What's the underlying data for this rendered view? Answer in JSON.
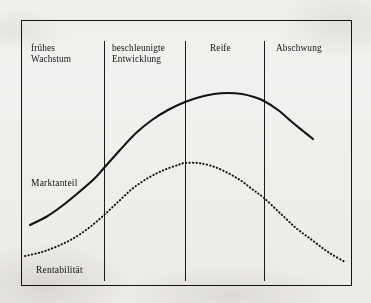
{
  "figure": {
    "background_color": "#f2f1ef",
    "ink_color": "#141414"
  },
  "stages": [
    {
      "id": "fruehes-wachstum",
      "label": "frühes\nWachstum",
      "x": 31,
      "y": 43
    },
    {
      "id": "beschleunigte-entwicklung",
      "label": "beschleunigte\nEntwicklung",
      "x": 112,
      "y": 43
    },
    {
      "id": "reife",
      "label": "Reife",
      "x": 210,
      "y": 43
    },
    {
      "id": "abschwung",
      "label": "Abschwung",
      "x": 276,
      "y": 43
    }
  ],
  "dividers": [
    {
      "id": "divider-1",
      "x": 104,
      "y_top": 41,
      "y_bottom": 281
    },
    {
      "id": "divider-2",
      "x": 185,
      "y_top": 41,
      "y_bottom": 281
    },
    {
      "id": "divider-3",
      "x": 264,
      "y_top": 41,
      "y_bottom": 281
    }
  ],
  "curve_labels": [
    {
      "id": "marktanteil",
      "label": "Marktanteil",
      "x": 31,
      "y": 178
    },
    {
      "id": "rentabilitaet",
      "label": "Rentabilität",
      "x": 36,
      "y": 265
    }
  ],
  "chart_data": {
    "type": "line",
    "xlabel": "",
    "ylabel": "",
    "grid": false,
    "legend_position": "inline-annotations",
    "x_axis_categories": [
      "frühes Wachstum",
      "beschleunigte Entwicklung",
      "Reife",
      "Abschwung"
    ],
    "x_category_boundaries_px": [
      104,
      185,
      264
    ],
    "series": [
      {
        "name": "Marktanteil",
        "style": "solid",
        "color": "#121212",
        "points_px": [
          [
            30,
            225
          ],
          [
            46,
            217
          ],
          [
            62,
            206
          ],
          [
            78,
            193
          ],
          [
            94,
            179
          ],
          [
            104,
            168
          ],
          [
            120,
            150
          ],
          [
            136,
            133
          ],
          [
            152,
            120
          ],
          [
            168,
            110
          ],
          [
            185,
            102
          ],
          [
            200,
            97
          ],
          [
            214,
            94
          ],
          [
            228,
            93
          ],
          [
            242,
            94
          ],
          [
            254,
            97
          ],
          [
            264,
            101
          ],
          [
            278,
            110
          ],
          [
            292,
            122
          ],
          [
            303,
            131
          ],
          [
            313,
            139
          ]
        ],
        "peak_px": [
          228,
          93
        ],
        "start_px": [
          30,
          225
        ],
        "end_px": [
          313,
          139
        ]
      },
      {
        "name": "Rentabilität",
        "style": "dotted",
        "color": "#121212",
        "points_px": [
          [
            25,
            256
          ],
          [
            42,
            252
          ],
          [
            58,
            246
          ],
          [
            74,
            238
          ],
          [
            90,
            227
          ],
          [
            104,
            215
          ],
          [
            118,
            202
          ],
          [
            132,
            189
          ],
          [
            148,
            178
          ],
          [
            164,
            170
          ],
          [
            178,
            165
          ],
          [
            185,
            163
          ],
          [
            198,
            163
          ],
          [
            212,
            166
          ],
          [
            226,
            172
          ],
          [
            240,
            180
          ],
          [
            252,
            189
          ],
          [
            264,
            198
          ],
          [
            280,
            213
          ],
          [
            296,
            228
          ],
          [
            312,
            240
          ],
          [
            328,
            252
          ],
          [
            345,
            262
          ]
        ],
        "peak_px": [
          185,
          163
        ],
        "start_px": [
          25,
          256
        ],
        "end_px": [
          345,
          262
        ]
      }
    ]
  }
}
